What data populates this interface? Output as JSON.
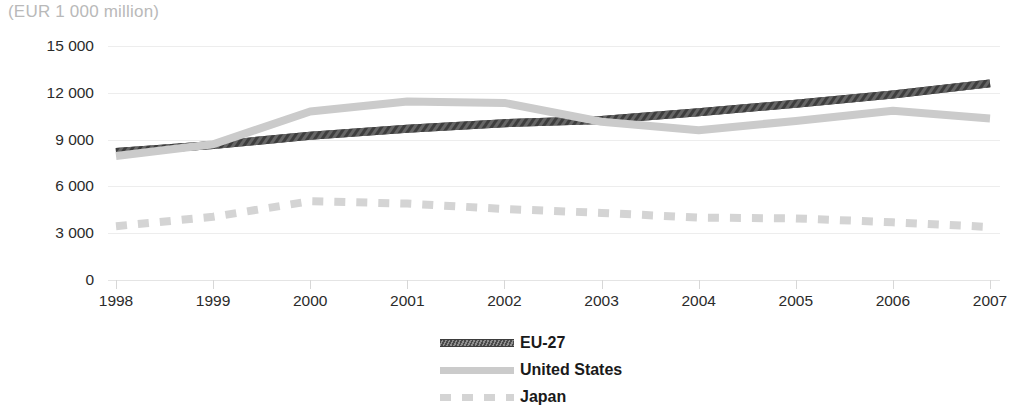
{
  "chart_data": {
    "type": "line",
    "title": "(EUR 1 000 million)",
    "xlabel": "",
    "ylabel": "",
    "ylim": [
      0,
      15000
    ],
    "yticks": [
      0,
      3000,
      6000,
      9000,
      12000,
      15000
    ],
    "ytick_labels": [
      "0",
      "3 000",
      "6 000",
      "9 000",
      "12 000",
      "15 000"
    ],
    "categories": [
      "1998",
      "1999",
      "2000",
      "2001",
      "2002",
      "2003",
      "2004",
      "2005",
      "2006",
      "2007"
    ],
    "x": [
      1998,
      1999,
      2000,
      2001,
      2002,
      2003,
      2004,
      2005,
      2006,
      2007
    ],
    "grid": true,
    "legend_position": "bottom-center",
    "series": [
      {
        "name": "EU-27",
        "style": "hatched-solid",
        "color": "#5a5a5a",
        "values": [
          8200,
          8650,
          9250,
          9700,
          10050,
          10250,
          10750,
          11300,
          11900,
          12600
        ]
      },
      {
        "name": "United States",
        "style": "solid",
        "color": "#cbcbcb",
        "values": [
          7950,
          8700,
          10800,
          11450,
          11350,
          10150,
          9600,
          10200,
          10850,
          10350
        ]
      },
      {
        "name": "Japan",
        "style": "dashed",
        "color": "#d4d4d4",
        "values": [
          3450,
          4050,
          5050,
          4900,
          4550,
          4300,
          4000,
          3950,
          3700,
          3400
        ]
      }
    ]
  },
  "legend": {
    "items": [
      {
        "label": "EU-27",
        "swatch": "line-hatched-dark-swatch"
      },
      {
        "label": "United States",
        "swatch": "line-solid-gray-swatch"
      },
      {
        "label": "Japan",
        "swatch": "line-dashed-gray-swatch"
      }
    ]
  },
  "colors": {
    "background": "#ffffff",
    "grid": "#ededed",
    "axis_text": "#2b2b2b",
    "title_text": "#b9b9b9",
    "eu27": "#5a5a5a",
    "united_states": "#cbcbcb",
    "japan": "#d4d4d4"
  }
}
